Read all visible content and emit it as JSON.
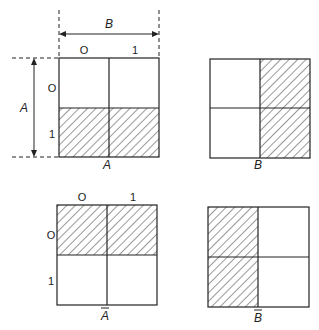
{
  "figure": {
    "axis_labels": {
      "A": "A",
      "B": "B"
    },
    "col_ticks": [
      "O",
      "1"
    ],
    "row_ticks": [
      "O",
      "1"
    ],
    "colors": {
      "line": "#222222",
      "hatch": "#333333",
      "background": "#ffffff"
    },
    "panels": [
      {
        "id": "A",
        "caption": "A",
        "overbar": false,
        "shaded": "bottom-row",
        "show_ticks": "both",
        "show_dimensions": true
      },
      {
        "id": "B",
        "caption": "B",
        "overbar": false,
        "shaded": "right-column",
        "show_ticks": "none",
        "show_dimensions": false
      },
      {
        "id": "not-A",
        "caption": "A",
        "overbar": true,
        "shaded": "top-row",
        "show_ticks": "both",
        "show_dimensions": false
      },
      {
        "id": "not-B",
        "caption": "B",
        "overbar": true,
        "shaded": "left-column",
        "show_ticks": "none",
        "show_dimensions": false
      }
    ]
  }
}
